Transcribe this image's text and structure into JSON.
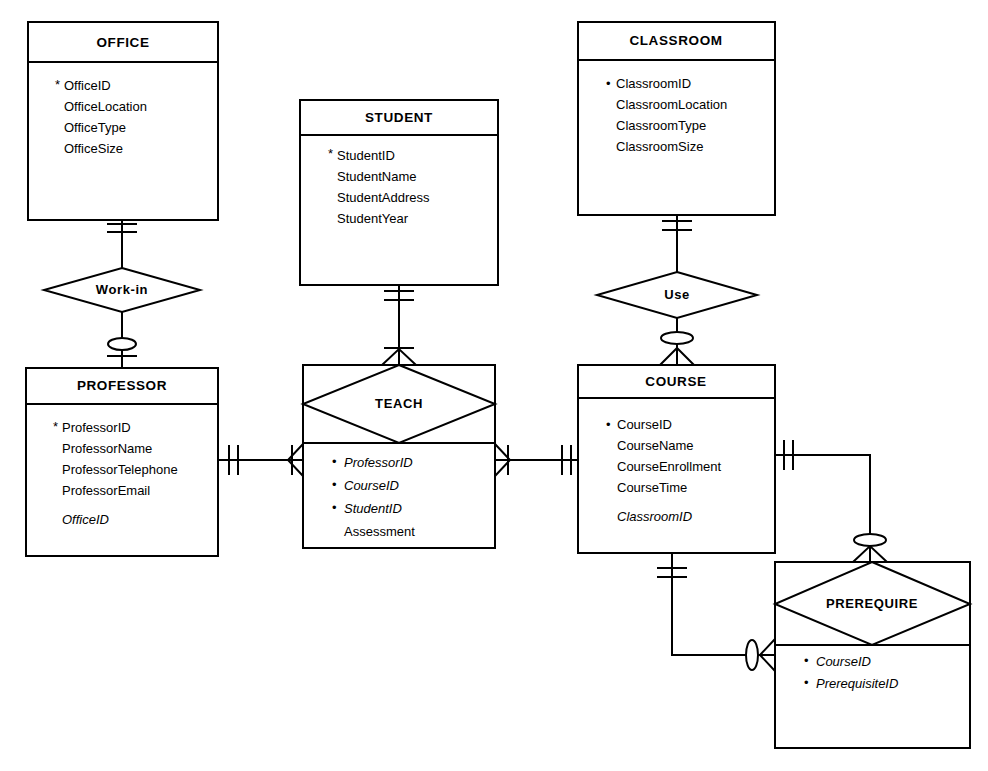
{
  "diagram": {
    "notation": "crow's foot",
    "background_color": "#ffffff",
    "line_color": "#000000"
  },
  "entities": [
    {
      "id": "office",
      "name": "OFFICE",
      "attributes": [
        {
          "label": "OfficeID",
          "key": true,
          "foreign": false
        },
        {
          "label": "OfficeLocation",
          "key": false,
          "foreign": false
        },
        {
          "label": "OfficeType",
          "key": false,
          "foreign": false
        },
        {
          "label": "OfficeSize",
          "key": false,
          "foreign": false
        }
      ]
    },
    {
      "id": "student",
      "name": "STUDENT",
      "attributes": [
        {
          "label": "StudentID",
          "key": true,
          "foreign": false
        },
        {
          "label": "StudentName",
          "key": false,
          "foreign": false
        },
        {
          "label": "StudentAddress",
          "key": false,
          "foreign": false
        },
        {
          "label": "StudentYear",
          "key": false,
          "foreign": false
        }
      ]
    },
    {
      "id": "classroom",
      "name": "CLASSROOM",
      "attributes": [
        {
          "label": "ClassroomID",
          "key": true,
          "foreign": false
        },
        {
          "label": "ClassroomLocation",
          "key": false,
          "foreign": false
        },
        {
          "label": "ClassroomType",
          "key": false,
          "foreign": false
        },
        {
          "label": "ClassroomSize",
          "key": false,
          "foreign": false
        }
      ]
    },
    {
      "id": "professor",
      "name": "PROFESSOR",
      "attributes": [
        {
          "label": "ProfessorID",
          "key": true,
          "foreign": false
        },
        {
          "label": "ProfessorName",
          "key": false,
          "foreign": false
        },
        {
          "label": "ProfessorTelephone",
          "key": false,
          "foreign": false
        },
        {
          "label": "ProfessorEmail",
          "key": false,
          "foreign": false
        },
        {
          "label": "OfficeID",
          "key": false,
          "foreign": true
        }
      ]
    },
    {
      "id": "course",
      "name": "COURSE",
      "attributes": [
        {
          "label": "CourseID",
          "key": true,
          "foreign": false
        },
        {
          "label": "CourseName",
          "key": false,
          "foreign": false
        },
        {
          "label": "CourseEnrollment",
          "key": false,
          "foreign": false
        },
        {
          "label": "CourseTime",
          "key": false,
          "foreign": false
        },
        {
          "label": "ClassroomID",
          "key": false,
          "foreign": true
        }
      ]
    }
  ],
  "relationships": [
    {
      "id": "work-in",
      "name": "Work-in",
      "type": "diamond"
    },
    {
      "id": "use",
      "name": "Use",
      "type": "diamond"
    }
  ],
  "associative_entities": [
    {
      "id": "teach",
      "name": "TEACH",
      "attributes": [
        {
          "label": "ProfessorID",
          "key": true,
          "foreign": true
        },
        {
          "label": "CourseID",
          "key": true,
          "foreign": true
        },
        {
          "label": "StudentID",
          "key": true,
          "foreign": true
        },
        {
          "label": "Assessment",
          "key": false,
          "foreign": false
        }
      ]
    },
    {
      "id": "prerequire",
      "name": "PREREQUIRE",
      "attributes": [
        {
          "label": "CourseID",
          "key": true,
          "foreign": true
        },
        {
          "label": "PrerequisiteID",
          "key": true,
          "foreign": true
        }
      ]
    }
  ],
  "symbols": {
    "bullet": "•",
    "key_marker": "*"
  }
}
